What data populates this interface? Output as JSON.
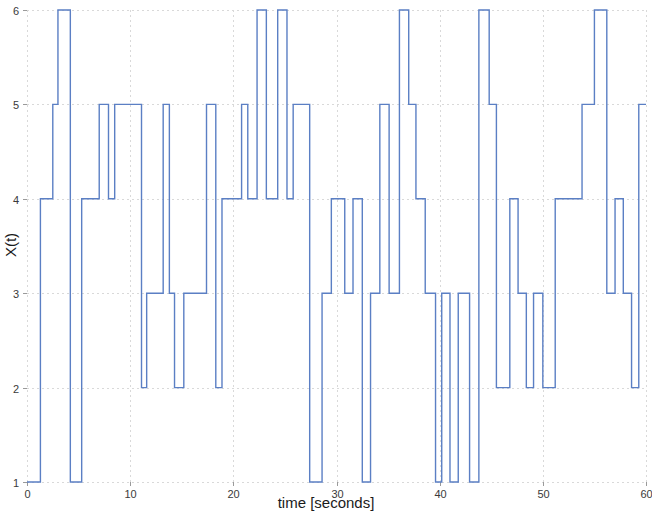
{
  "figure": {
    "background_color": "#ffffff",
    "width": 652,
    "height": 515
  },
  "axes": {
    "x_title": "time [seconds]",
    "y_title": "X(t)",
    "x_ticks": [
      "0",
      "10",
      "20",
      "30",
      "40",
      "50",
      "60"
    ],
    "y_ticks": [
      "1",
      "2",
      "3",
      "4",
      "5",
      "6"
    ]
  },
  "chart_data": {
    "type": "line",
    "title": "",
    "subtitle": "",
    "xlabel": "time [seconds]",
    "ylabel": "X(t)",
    "xlim": [
      0,
      60
    ],
    "ylim": [
      1,
      6
    ],
    "xticks": [
      0,
      10,
      20,
      30,
      40,
      50,
      60
    ],
    "yticks": [
      1,
      2,
      3,
      4,
      5,
      6
    ],
    "grid": true,
    "legend": null,
    "line_color": "#5b7fc4",
    "line_width": 1.4,
    "drawstyle": "steps-post",
    "annotations": [],
    "series": [
      {
        "name": "X(t)",
        "description": "Right-continuous jump process on states 1..6; value holds constant from each x until the next x.",
        "x": [
          0.0,
          1.3,
          2.5,
          3.0,
          4.2,
          5.3,
          7.0,
          7.9,
          8.5,
          11.1,
          11.6,
          13.2,
          13.8,
          14.3,
          15.2,
          17.4,
          18.3,
          18.9,
          20.8,
          21.4,
          22.3,
          23.2,
          24.3,
          25.2,
          25.8,
          27.4,
          28.6,
          29.5,
          30.8,
          31.6,
          32.5,
          33.3,
          34.2,
          35.1,
          36.1,
          37.0,
          37.7,
          38.6,
          39.6,
          40.2,
          41.0,
          41.8,
          42.9,
          43.8,
          44.8,
          45.5,
          46.8,
          47.6,
          48.4,
          49.1,
          50.0,
          51.2,
          53.8,
          55.0,
          56.2,
          57.0,
          57.8,
          58.6,
          59.3,
          60.0
        ],
        "y": [
          1,
          4,
          5,
          6,
          1,
          4,
          5,
          4,
          5,
          2,
          3,
          5,
          3,
          2,
          3,
          5,
          2,
          4,
          5,
          4,
          6,
          4,
          6,
          4,
          5,
          1,
          3,
          4,
          3,
          4,
          1,
          3,
          5,
          3,
          6,
          5,
          4,
          3,
          1,
          3,
          1,
          3,
          1,
          6,
          5,
          2,
          4,
          3,
          2,
          3,
          2,
          4,
          5,
          6,
          3,
          4,
          3,
          2,
          5,
          5
        ]
      }
    ]
  }
}
